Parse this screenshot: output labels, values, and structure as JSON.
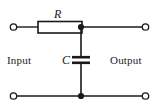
{
  "figure": {
    "kind": "schematic-diagram",
    "background_color": "#ffffff",
    "line_color": "#1a1a1a",
    "label_color": "#1a1a1a"
  },
  "labels": {
    "input": "Input",
    "output": "Output",
    "resistor": "R",
    "capacitor": "C"
  },
  "components": {
    "resistor": {
      "name": "resistor-R",
      "symbol": "rectangle-box",
      "x": 38,
      "y": 22,
      "width": 44,
      "height": 11
    },
    "capacitor": {
      "name": "capacitor-C",
      "symbol": "parallel-plates",
      "plate_x_start": 72,
      "plate_x_end": 89,
      "plate_top_y": 57,
      "plate_bottom_y": 63
    }
  },
  "terminals": [
    {
      "name": "input-top-terminal",
      "x": 13,
      "y": 27,
      "style": "open-circle"
    },
    {
      "name": "input-bottom-terminal",
      "x": 13,
      "y": 96,
      "style": "open-circle"
    },
    {
      "name": "output-top-terminal",
      "x": 146,
      "y": 27,
      "style": "open-circle"
    },
    {
      "name": "output-bottom-terminal",
      "x": 146,
      "y": 96,
      "style": "open-circle"
    }
  ],
  "junctions": [
    {
      "name": "top-node-junction",
      "x": 81,
      "y": 27,
      "style": "filled-dot"
    },
    {
      "name": "bottom-node-junction",
      "x": 81,
      "y": 96,
      "style": "filled-dot"
    }
  ],
  "wires": [
    {
      "name": "input-top-wire",
      "x1": 17,
      "y1": 27,
      "x2": 38,
      "y2": 27
    },
    {
      "name": "resistor-to-node-wire",
      "x1": 82,
      "y1": 27,
      "x2": 81,
      "y2": 27
    },
    {
      "name": "node-to-output-top-wire",
      "x1": 81,
      "y1": 27,
      "x2": 142,
      "y2": 27
    },
    {
      "name": "bottom-rail-left-wire",
      "x1": 17,
      "y1": 96,
      "x2": 81,
      "y2": 96
    },
    {
      "name": "bottom-rail-right-wire",
      "x1": 81,
      "y1": 96,
      "x2": 142,
      "y2": 96
    },
    {
      "name": "capacitor-upper-branch-wire",
      "x1": 81,
      "y1": 27,
      "x2": 81,
      "y2": 57
    },
    {
      "name": "capacitor-lower-branch-wire",
      "x1": 81,
      "y1": 63,
      "x2": 81,
      "y2": 96
    }
  ]
}
